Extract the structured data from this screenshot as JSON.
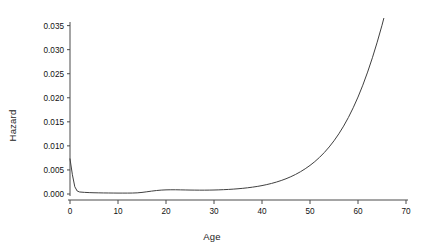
{
  "chart_data": {
    "type": "line",
    "title": "",
    "xlabel": "Age",
    "ylabel": "Hazard",
    "xlim": [
      0,
      70
    ],
    "ylim": [
      0,
      0.0365
    ],
    "grid": false,
    "legend": null,
    "xticks": [
      0,
      10,
      20,
      30,
      40,
      50,
      60,
      70
    ],
    "xtick_labels": [
      "0",
      "10",
      "20",
      "30",
      "40",
      "50",
      "60",
      "70"
    ],
    "yticks": [
      0.0,
      0.005,
      0.01,
      0.015,
      0.02,
      0.025,
      0.03,
      0.035
    ],
    "ytick_labels": [
      "0.000",
      "0.005",
      "0.010",
      "0.015",
      "0.020",
      "0.025",
      "0.030",
      "0.035"
    ],
    "series": [
      {
        "name": "Hazard",
        "color": "#404040",
        "x": [
          0,
          0.5,
          1,
          1.5,
          2,
          3,
          4,
          5,
          6,
          7,
          8,
          9,
          10,
          11,
          12,
          13,
          14,
          15,
          16,
          17,
          18,
          19,
          20,
          21,
          22,
          23,
          24,
          25,
          26,
          27,
          28,
          29,
          30,
          31,
          32,
          33,
          34,
          35,
          36,
          37,
          38,
          39,
          40,
          41,
          42,
          43,
          44,
          45,
          46,
          47,
          48,
          49,
          50,
          51,
          52,
          53,
          54,
          55,
          56,
          57,
          58,
          59,
          60,
          61,
          62,
          63,
          64,
          65,
          66,
          67,
          68,
          69,
          70
        ],
        "y": [
          0.0073,
          0.004,
          0.0015,
          0.00062,
          0.00042,
          0.00034,
          0.00029,
          0.00026,
          0.00024,
          0.00022,
          0.00021,
          0.0002,
          0.00019,
          0.00019,
          0.00019,
          0.0002,
          0.00024,
          0.00033,
          0.00046,
          0.0006,
          0.00072,
          0.00081,
          0.00086,
          0.00088,
          0.00088,
          0.00086,
          0.00084,
          0.00082,
          0.00081,
          0.0008,
          0.0008,
          0.00081,
          0.00083,
          0.00086,
          0.0009,
          0.00095,
          0.00101,
          0.00109,
          0.00118,
          0.00129,
          0.00142,
          0.00157,
          0.00175,
          0.00196,
          0.0022,
          0.00248,
          0.0028,
          0.00317,
          0.00359,
          0.00407,
          0.00462,
          0.00524,
          0.00594,
          0.00673,
          0.00763,
          0.00864,
          0.00978,
          0.01106,
          0.0125,
          0.01411,
          0.01591,
          0.01792,
          0.02015,
          0.02262,
          0.02534,
          0.02832,
          0.03156,
          0.03508,
          0.03886,
          0.0429,
          0.04718,
          0.05168,
          0.05636
        ]
      }
    ],
    "annotations": []
  },
  "axes": {
    "ylabel_text": "Hazard",
    "xlabel_text": "Age"
  }
}
